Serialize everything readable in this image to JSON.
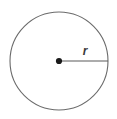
{
  "figure": {
    "kind": "geometry-diagram",
    "background_color": "#ffffff",
    "stroke_color": "#6b6b6b",
    "radius_line_color": "#5a5a5a",
    "center_dot_color": "#1a1a1a",
    "label_color": "#3a3a3a",
    "circle": {
      "center_x": 59,
      "center_y": 61,
      "radius": 49,
      "stroke_width": 1.1,
      "fill": "none"
    },
    "center_point": {
      "x": 59,
      "y": 61,
      "dot_radius": 3.1
    },
    "radius_segment": {
      "x1": 59,
      "y1": 61,
      "x2": 108,
      "y2": 61,
      "stroke_width": 1.2
    },
    "radius_label": {
      "text": "r",
      "x": 85,
      "y": 55
    }
  }
}
